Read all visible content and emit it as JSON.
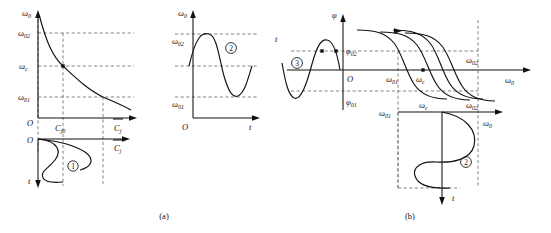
{
  "figure": {
    "captions": {
      "a": "(a)",
      "b": "(b)"
    }
  },
  "panel_a": {
    "plot_top_left": {
      "y_axis_label": "ω",
      "y_axis_sub": "0",
      "x_axis_label": "C",
      "x_axis_sub": "j",
      "origin_label": "O",
      "y_ticks": [
        {
          "label": "ω",
          "sub": "02"
        },
        {
          "label": "ω",
          "sub": "c"
        },
        {
          "label": "ω",
          "sub": "01"
        }
      ],
      "x_ticks": [
        {
          "label": "C",
          "sub": "j0"
        }
      ],
      "curve_type": "decaying-hyperbola",
      "marked_points": 1
    },
    "plot_bottom_left": {
      "origin_label": "O",
      "x_axis_label": "C",
      "x_axis_sub": "j",
      "y_axis_label": "t",
      "y_axis_direction": "down",
      "curve_type": "sine-vertical",
      "badge": "①"
    },
    "plot_top_right": {
      "y_axis_label": "ω",
      "y_axis_sub": "0",
      "x_axis_label": "t",
      "origin_label": "O",
      "y_ticks": [
        {
          "label": "ω",
          "sub": "02"
        },
        {
          "label": "ω",
          "sub": "01"
        }
      ],
      "curve_type": "sine",
      "badge": "②"
    }
  },
  "panel_b": {
    "plot_phase": {
      "y_axis_label": "φ",
      "x_axis_label": "ω",
      "x_axis_sub": "0",
      "origin_label": "O",
      "t_axis_label": "t",
      "y_ticks": [
        {
          "label": "φ",
          "sub": "02"
        },
        {
          "label": "φ",
          "sub": "01"
        }
      ],
      "x_ticks": [
        {
          "label": "ω",
          "sub": "01"
        },
        {
          "label": "ω",
          "sub": "c"
        },
        {
          "label": "ω",
          "sub": "02"
        }
      ],
      "left_badge": "③",
      "curve_family_count": 4,
      "marked_points": 3
    },
    "plot_lower": {
      "x_axis_label": "ω",
      "x_axis_sub": "0",
      "y_axis_label": "t",
      "y_axis_direction": "down",
      "x_ticks": [
        {
          "label": "ω",
          "sub": "01"
        },
        {
          "label": "ω",
          "sub": "c"
        },
        {
          "label": "ω",
          "sub": "02"
        }
      ],
      "curve_type": "sine-vertical",
      "badge": "②"
    }
  }
}
